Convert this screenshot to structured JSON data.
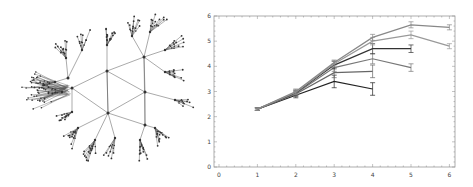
{
  "network": {
    "description": "Tree-like network graph with hexagonal core and branching leaf clusters",
    "edge_color": "#555555",
    "node_color": "#333333"
  },
  "chart_data": {
    "type": "line",
    "title": "",
    "xlabel": "",
    "ylabel": "",
    "xlim": [
      0,
      6
    ],
    "ylim": [
      0,
      6
    ],
    "x_ticks": [
      "0",
      "1",
      "2",
      "3",
      "4",
      "5",
      "6"
    ],
    "y_ticks": [
      "0",
      "1",
      "2",
      "3",
      "4",
      "5",
      "6"
    ],
    "grid": false,
    "legend": null,
    "error_bars": true,
    "series": [
      {
        "name": "s1",
        "color": "#222222",
        "x": [
          1,
          2,
          3,
          4
        ],
        "values": [
          2.3,
          2.85,
          3.4,
          3.1
        ],
        "err": [
          0.05,
          0.1,
          0.25,
          0.25
        ]
      },
      {
        "name": "s2",
        "color": "#666666",
        "x": [
          1,
          2,
          3,
          4
        ],
        "values": [
          2.3,
          2.9,
          3.75,
          3.8
        ],
        "err": [
          0.05,
          0.1,
          0.2,
          0.25
        ]
      },
      {
        "name": "s3",
        "color": "#777777",
        "x": [
          1,
          2,
          3,
          4,
          5
        ],
        "values": [
          2.3,
          2.92,
          3.95,
          4.3,
          3.95
        ],
        "err": [
          0.05,
          0.1,
          0.15,
          0.2,
          0.15
        ]
      },
      {
        "name": "s4",
        "color": "#333333",
        "x": [
          1,
          2,
          3,
          4,
          5
        ],
        "values": [
          2.3,
          2.95,
          4.05,
          4.7,
          4.7
        ],
        "err": [
          0.05,
          0.1,
          0.15,
          0.2,
          0.15
        ]
      },
      {
        "name": "s5",
        "color": "#999999",
        "x": [
          1,
          2,
          3,
          4,
          5,
          6
        ],
        "values": [
          2.3,
          2.97,
          4.1,
          5.0,
          5.25,
          4.8
        ],
        "err": [
          0.05,
          0.1,
          0.12,
          0.15,
          0.15,
          0.1
        ]
      },
      {
        "name": "s6",
        "color": "#888888",
        "x": [
          1,
          2,
          3,
          4,
          5,
          6
        ],
        "values": [
          2.3,
          3.0,
          4.15,
          5.15,
          5.65,
          5.55
        ],
        "err": [
          0.05,
          0.1,
          0.1,
          0.12,
          0.12,
          0.1
        ]
      }
    ]
  }
}
